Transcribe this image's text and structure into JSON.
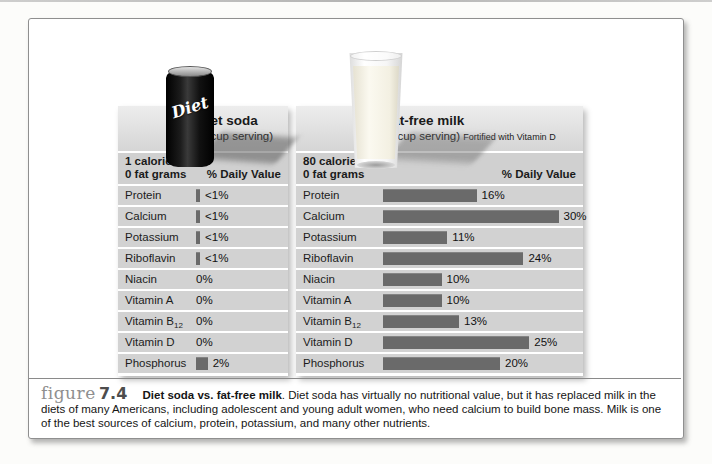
{
  "colors": {
    "bar": "#6a6a6a",
    "row_background": "#d2d2d2",
    "panel_header_gradient_top": "#ededed",
    "panel_header_gradient_bottom": "#d5d5d5",
    "box_border": "#8f8f8f",
    "caption_figure_word": "#8f8f8f"
  },
  "products": {
    "soda_can_label": "Diet",
    "soda_can_image": "black diet soda can",
    "milk_glass_image": "glass of milk"
  },
  "chart_data": [
    {
      "type": "bar",
      "title": "Diet soda",
      "subtitle": "(1 cup serving)",
      "note": "",
      "header": [
        "1 calorie",
        "0 fat grams"
      ],
      "value_axis_label": "% Daily Value",
      "categories": [
        "Protein",
        "Calcium",
        "Potassium",
        "Riboflavin",
        "Niacin",
        "Vitamin A",
        "Vitamin B12",
        "Vitamin D",
        "Phosphorus"
      ],
      "value_labels": [
        "<1%",
        "<1%",
        "<1%",
        "<1%",
        "0%",
        "0%",
        "0%",
        "0%",
        "2%"
      ],
      "values": [
        0.7,
        0.7,
        0.7,
        0.7,
        0,
        0,
        0,
        0,
        2
      ],
      "xlim": [
        0,
        30
      ],
      "unit": "percent daily value",
      "orientation": "horizontal",
      "grid": false,
      "legend": false
    },
    {
      "type": "bar",
      "title": "Fat-free milk",
      "subtitle": "(1 cup serving)",
      "note": "Fortified with Vitamin D",
      "header": [
        "80 calories",
        "0 fat grams"
      ],
      "value_axis_label": "% Daily Value",
      "categories": [
        "Protein",
        "Calcium",
        "Potassium",
        "Riboflavin",
        "Niacin",
        "Vitamin A",
        "Vitamin B12",
        "Vitamin D",
        "Phosphorus"
      ],
      "value_labels": [
        "16%",
        "30%",
        "11%",
        "24%",
        "10%",
        "10%",
        "13%",
        "25%",
        "20%"
      ],
      "values": [
        16,
        30,
        11,
        24,
        10,
        10,
        13,
        25,
        20
      ],
      "xlim": [
        0,
        30
      ],
      "unit": "percent daily value",
      "orientation": "horizontal",
      "grid": false,
      "legend": false
    }
  ],
  "caption": {
    "figure_word": "figure",
    "figure_number": "7.4",
    "title": "Diet soda vs. fat-free milk",
    "body": ". Diet soda has virtually no nutritional value, but it has replaced milk in the diets of many Americans, including adolescent and young adult women, who need calcium to build bone mass. Milk is one of the best sources of calcium, protein, potassium, and many other nutrients."
  }
}
